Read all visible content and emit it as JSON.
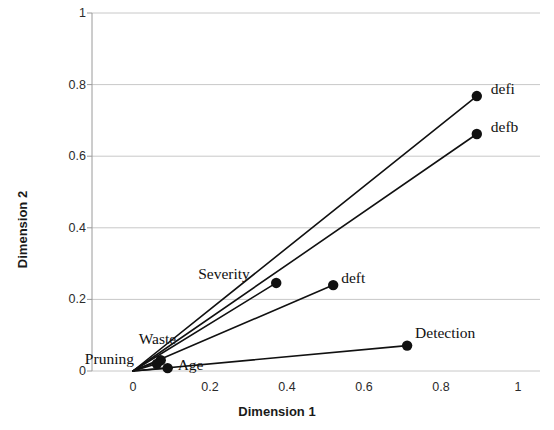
{
  "chart_data": {
    "type": "scatter",
    "title": "",
    "xlabel": "Dimension 1",
    "ylabel": "Dimension 2",
    "xlim": [
      0,
      1
    ],
    "ylim": [
      0,
      1
    ],
    "xticks": [
      "0",
      "0.2",
      "0.4",
      "0.6",
      "0.8",
      "1"
    ],
    "xtick_values": [
      0,
      0.2,
      0.4,
      0.6,
      0.8,
      1
    ],
    "yticks": [
      "0",
      "0.2",
      "0.4",
      "0.6",
      "0.8",
      "1"
    ],
    "ytick_values": [
      0,
      0.2,
      0.4,
      0.6,
      0.8,
      1
    ],
    "grid": true,
    "grid_color": "#c8c8c8",
    "legend": "none",
    "marker_color": "#111111",
    "line_color": "#111111",
    "points": [
      {
        "label": "defi",
        "x": 0.893,
        "y": 0.768,
        "label_dx": 14,
        "label_dy": -16
      },
      {
        "label": "defb",
        "x": 0.893,
        "y": 0.662,
        "label_dx": 14,
        "label_dy": -16
      },
      {
        "label": "deft",
        "x": 0.52,
        "y": 0.24,
        "label_dx": 8,
        "label_dy": -16
      },
      {
        "label": "Severity",
        "x": 0.372,
        "y": 0.246,
        "label_dx": -78,
        "label_dy": -18
      },
      {
        "label": "Detection",
        "x": 0.712,
        "y": 0.071,
        "label_dx": 8,
        "label_dy": -22
      },
      {
        "label": "Waste",
        "x": 0.072,
        "y": 0.03,
        "label_dx": -22,
        "label_dy": -30
      },
      {
        "label": "Pruning",
        "x": 0.062,
        "y": 0.02,
        "label_dx": -72,
        "label_dy": -14
      },
      {
        "label": "Age",
        "x": 0.09,
        "y": 0.008,
        "label_dx": 10,
        "label_dy": -12
      }
    ]
  },
  "axes": {
    "x_title": "Dimension 1",
    "y_title": "Dimension 2"
  }
}
